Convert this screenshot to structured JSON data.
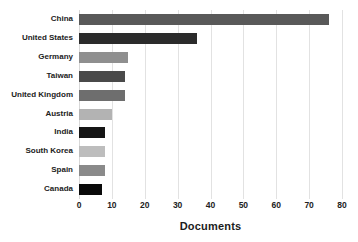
{
  "chart_data": {
    "type": "bar",
    "orientation": "horizontal",
    "title": "",
    "xlabel": "Documents",
    "ylabel": "",
    "xlim": [
      0,
      80
    ],
    "xticks": [
      0,
      10,
      20,
      30,
      40,
      50,
      60,
      70,
      80
    ],
    "grid": "vertical",
    "legend": "none",
    "categories": [
      "China",
      "United States",
      "Germany",
      "Taiwan",
      "United Kingdom",
      "Austria",
      "India",
      "South Korea",
      "Spain",
      "Canada"
    ],
    "values": [
      76,
      36,
      15,
      14,
      14,
      10,
      8,
      8,
      8,
      7
    ],
    "bar_colors": [
      "#595959",
      "#2b2b2b",
      "#8f8f8f",
      "#4a4a4a",
      "#6e6e6e",
      "#b3b3b3",
      "#151515",
      "#bdbdbd",
      "#8a8a8a",
      "#0a0a0a"
    ],
    "background_color": "#ffffff",
    "gridline_color": "#e2e2e2",
    "text_color": "#222222"
  }
}
